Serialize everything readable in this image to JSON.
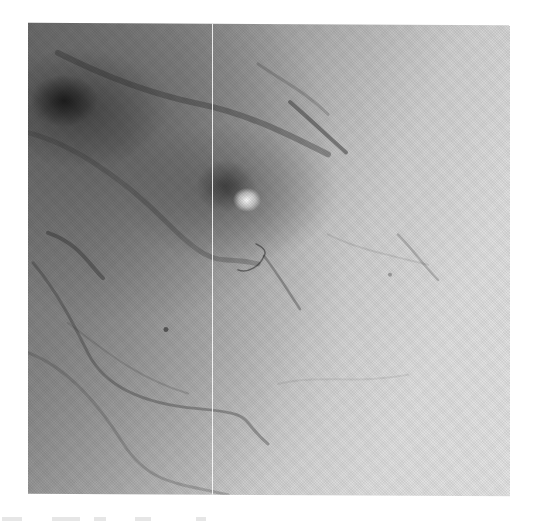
{
  "image": {
    "description": "Grayscale photographic micrograph (fundus-like) with a dark blob at upper left, a bright round spot surrounded by a dark halo near center, branching vessel-like lines, and a thin vertical white line artifact",
    "tones": {
      "darkest": "#1e1e1e",
      "dark": "#6e6e6e",
      "mid": "#b3b3b3",
      "light": "#e3e3e3",
      "bright_spot": "#fafafa",
      "background": "#ffffff"
    },
    "features": [
      {
        "name": "dark-blob",
        "x": 62,
        "y": 100
      },
      {
        "name": "bright-spot",
        "x": 247,
        "y": 200
      },
      {
        "name": "dark-halo",
        "x": 225,
        "y": 185
      },
      {
        "name": "vertical-line-artifact",
        "x": 212
      }
    ]
  },
  "caption": {
    "visible": "partial (cut off, illegible)"
  }
}
